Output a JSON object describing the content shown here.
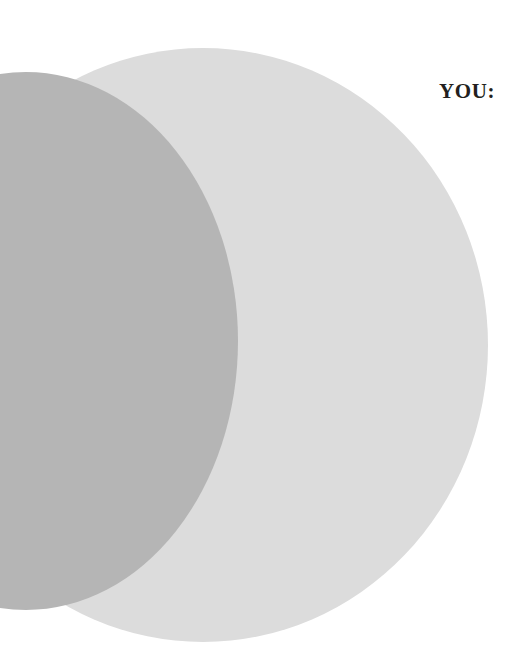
{
  "page": {
    "background_color": "#ffffff",
    "width": 530,
    "height": 659
  },
  "headline": {
    "text": "YOU:",
    "color": "#231f20",
    "style": "bold-serif-uppercase"
  },
  "decoration": {
    "name": "overlapping-ellipses",
    "shapes": [
      {
        "id": "ellipse-light",
        "icon": "ellipse-icon",
        "fill": "#dcdcdc",
        "label": "light gray ellipse"
      },
      {
        "id": "ellipse-dark",
        "icon": "ellipse-icon",
        "fill": "#b5b5b5",
        "label": "dark gray ellipse overlap"
      }
    ]
  }
}
